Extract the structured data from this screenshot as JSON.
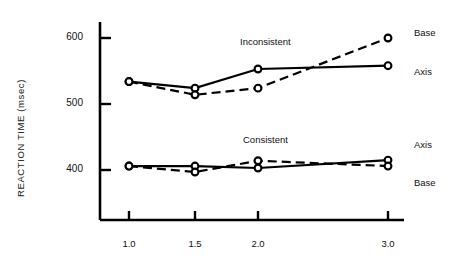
{
  "chart_data": {
    "type": "line",
    "title": "",
    "xlabel": "",
    "ylabel": "REACTION TIME (msec)",
    "categories": [
      "1.0",
      "1.5",
      "2.0",
      "3.0"
    ],
    "x": [
      1.0,
      1.5,
      2.0,
      3.0
    ],
    "ylim": [
      330,
      625
    ],
    "yticks": [
      400,
      500,
      600
    ],
    "ytick_labels": [
      "400",
      "500",
      "600"
    ],
    "xtick_labels": [
      "1.0",
      "1.5",
      "2.0",
      "3.0"
    ],
    "grid": false,
    "legend_position": "right-inline",
    "annotations": [
      {
        "text": "Inconsistent",
        "x": 2.0,
        "y": 580
      },
      {
        "text": "Consistent",
        "x": 2.0,
        "y": 455
      }
    ],
    "right_labels": [
      {
        "text": "Base",
        "series": "Inconsistent-Base",
        "y": 600
      },
      {
        "text": "Axis",
        "series": "Inconsistent-Axis",
        "y": 558
      },
      {
        "text": "Axis",
        "series": "Consistent-Axis",
        "y": 415
      },
      {
        "text": "Base",
        "series": "Consistent-Base",
        "y": 406
      }
    ],
    "series": [
      {
        "name": "Inconsistent Axis",
        "group": "Inconsistent",
        "condition": "Axis",
        "style": "solid",
        "marker": "open-circle",
        "values": [
          534,
          524,
          553,
          558
        ]
      },
      {
        "name": "Inconsistent Base",
        "group": "Inconsistent",
        "condition": "Base",
        "style": "dashed",
        "marker": "open-circle",
        "values": [
          534,
          514,
          524,
          600
        ]
      },
      {
        "name": "Consistent Axis",
        "group": "Consistent",
        "condition": "Axis",
        "style": "solid",
        "marker": "open-circle",
        "values": [
          406,
          406,
          403,
          415
        ]
      },
      {
        "name": "Consistent Base",
        "group": "Consistent",
        "condition": "Base",
        "style": "dashed",
        "marker": "open-circle",
        "values": [
          406,
          397,
          414,
          406
        ]
      }
    ]
  },
  "axes": {
    "y_title": "REACTION TIME (msec)",
    "y_ticks": [
      "600",
      "500",
      "400"
    ],
    "x_ticks": [
      "1.0",
      "1.5",
      "2.0",
      "3.0"
    ]
  },
  "labels": {
    "inconsistent": "Inconsistent",
    "consistent": "Consistent",
    "base_top": "Base",
    "axis_top": "Axis",
    "axis_bottom": "Axis",
    "base_bottom": "Base"
  },
  "colors": {
    "line": "#000000",
    "text": "#111111",
    "background": "#ffffff"
  }
}
